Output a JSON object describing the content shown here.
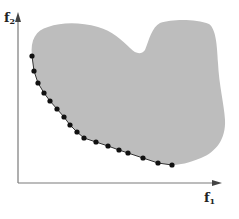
{
  "figure": {
    "type": "pareto-front-illustration",
    "axes": {
      "x_label": "f",
      "x_label_sub": "1",
      "y_label": "f",
      "y_label_sub": "2"
    },
    "colors": {
      "region_fill": "#bdbdbd",
      "axis": "#7a7a7a",
      "front_line": "#333333",
      "front_points": "#111111",
      "background": "#ffffff"
    },
    "feasible_region": {
      "description": "Gray irregular objective-space region"
    },
    "pareto_front": {
      "description": "Dotted curve along lower-left boundary of region",
      "points": [
        [
          32,
          56
        ],
        [
          34,
          71
        ],
        [
          38,
          83
        ],
        [
          44,
          93
        ],
        [
          50,
          101
        ],
        [
          57,
          109
        ],
        [
          64,
          117
        ],
        [
          70,
          125
        ],
        [
          77,
          132
        ],
        [
          84,
          138
        ],
        [
          96,
          142
        ],
        [
          108,
          146
        ],
        [
          119,
          150
        ],
        [
          128,
          153
        ],
        [
          143,
          158
        ],
        [
          158,
          163
        ],
        [
          172,
          165
        ]
      ]
    }
  }
}
